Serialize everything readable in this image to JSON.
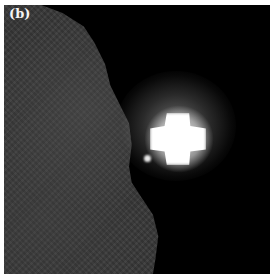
{
  "figure": {
    "panel_label": "(b)",
    "colors": {
      "background": "#000000",
      "grey_region": "#3a3a3a",
      "bright_feature": "#ffffff",
      "margin": "#ffffff"
    }
  }
}
